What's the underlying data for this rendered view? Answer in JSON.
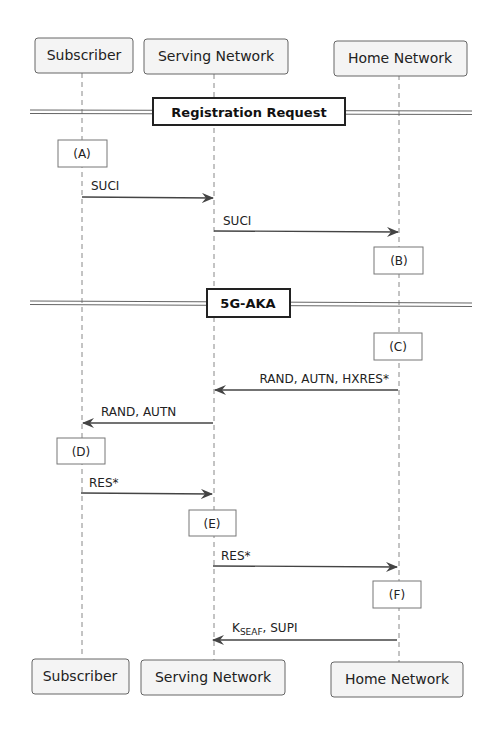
{
  "diagram": {
    "type": "sequence",
    "participants": [
      {
        "id": "subscriber",
        "label": "Subscriber"
      },
      {
        "id": "serving",
        "label": "Serving Network"
      },
      {
        "id": "home",
        "label": "Home Network"
      }
    ],
    "dividers": [
      {
        "label": "Registration Request"
      },
      {
        "label": "5G-AKA"
      }
    ],
    "steps": [
      {
        "kind": "note",
        "at": "subscriber",
        "label": "(A)"
      },
      {
        "kind": "message",
        "from": "subscriber",
        "to": "serving",
        "label": "SUCI"
      },
      {
        "kind": "message",
        "from": "serving",
        "to": "home",
        "label": "SUCI"
      },
      {
        "kind": "note",
        "at": "home",
        "label": "(B)"
      },
      {
        "kind": "note",
        "at": "home",
        "label": "(C)"
      },
      {
        "kind": "message",
        "from": "home",
        "to": "serving",
        "label": "RAND, AUTN, HXRES*"
      },
      {
        "kind": "message",
        "from": "serving",
        "to": "subscriber",
        "label": "RAND, AUTN"
      },
      {
        "kind": "note",
        "at": "subscriber",
        "label": "(D)"
      },
      {
        "kind": "message",
        "from": "subscriber",
        "to": "serving",
        "label": "RES*"
      },
      {
        "kind": "note",
        "at": "serving",
        "label": "(E)"
      },
      {
        "kind": "message",
        "from": "serving",
        "to": "home",
        "label": "RES*"
      },
      {
        "kind": "note",
        "at": "home",
        "label": "(F)"
      },
      {
        "kind": "message",
        "from": "home",
        "to": "serving",
        "label": "K",
        "label_sub": "SEAF",
        "label_suffix": ", SUPI"
      }
    ]
  }
}
